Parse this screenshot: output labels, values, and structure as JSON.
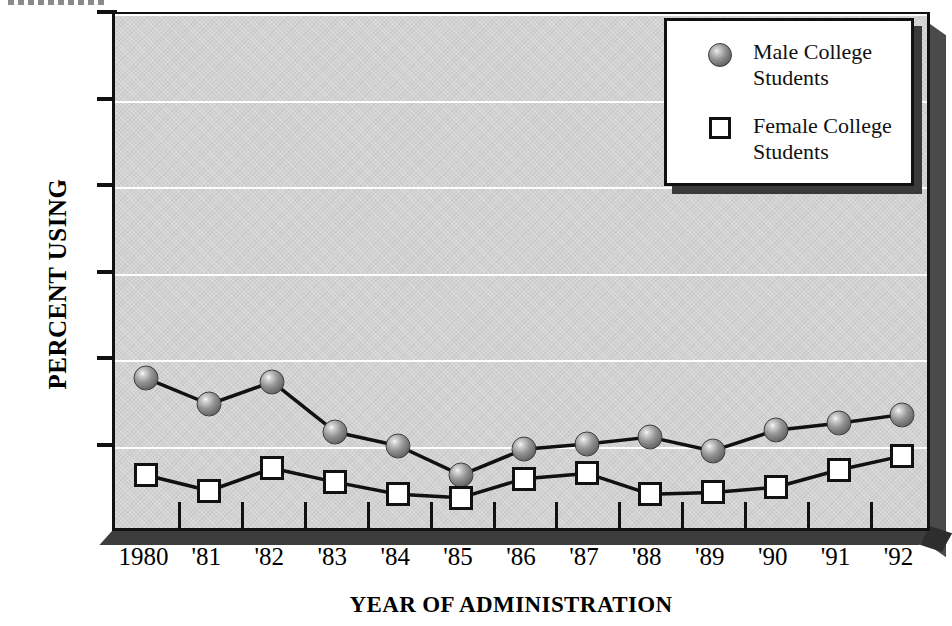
{
  "chart_data": {
    "type": "line",
    "title": "",
    "xlabel": "YEAR OF ADMINISTRATION",
    "ylabel": "PERCENT USING",
    "categories": [
      "1980",
      "'81",
      "'82",
      "'83",
      "'84",
      "'85",
      "'86",
      "'87",
      "'88",
      "'89",
      "'90",
      "'91",
      "'92"
    ],
    "ylim": [
      0,
      30
    ],
    "yticks": [
      0,
      5,
      10,
      15,
      20,
      25,
      30
    ],
    "ytick_labels": [
      "0",
      "5",
      "10",
      "15",
      "20",
      "25",
      "30"
    ],
    "grid": "horizontal-white",
    "legend_position": "top-right",
    "series": [
      {
        "name": "Male College Students",
        "marker": "filled-gray-sphere",
        "values": [
          9.0,
          7.5,
          8.8,
          5.9,
          5.1,
          3.4,
          4.9,
          5.2,
          5.6,
          4.8,
          6.0,
          6.4,
          6.9
        ]
      },
      {
        "name": "Female College Students",
        "marker": "open-white-square",
        "values": [
          3.4,
          2.5,
          3.8,
          3.0,
          2.3,
          2.1,
          3.2,
          3.5,
          2.3,
          2.4,
          2.7,
          3.7,
          4.5
        ]
      }
    ]
  },
  "legend": {
    "entries": [
      {
        "label_line1": "Male College",
        "label_line2": "Students"
      },
      {
        "label_line1": "Female College",
        "label_line2": "Students"
      }
    ]
  },
  "colors": {
    "plot_background": "#d2d2d2",
    "gridline": "#fdfdfd",
    "axis": "#111111",
    "male_marker": "#7d7d7d",
    "female_marker": "#ffffff",
    "shadow": "#3a3a3a"
  }
}
